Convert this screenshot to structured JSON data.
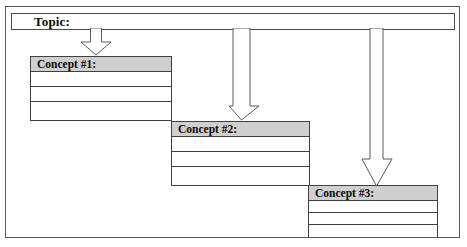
{
  "document": {
    "title": "Concept Map Template",
    "type": "graphic-organizer"
  },
  "topic": {
    "label": "Topic:",
    "value": ""
  },
  "concepts": [
    {
      "header": "Concept #1:",
      "rows": [
        "",
        "",
        ""
      ]
    },
    {
      "header": "Concept #2:",
      "rows": [
        "",
        "",
        ""
      ]
    },
    {
      "header": "Concept #3:",
      "rows": [
        "",
        "",
        ""
      ]
    }
  ],
  "connectors": [
    {
      "name": "arrow-topic-to-concept-1",
      "glyph": "down-arrow"
    },
    {
      "name": "arrow-topic-to-concept-2",
      "glyph": "down-arrow"
    },
    {
      "name": "arrow-topic-to-concept-3",
      "glyph": "down-arrow"
    }
  ],
  "colors": {
    "page_background": "#ffffff",
    "frame_border": "#58585a",
    "box_border": "#3f3f41",
    "header_fill": "#cfcfcf",
    "text": "#0b0b0b",
    "arrow_fill": "#ffffff",
    "arrow_stroke": "#5a5a5c"
  }
}
